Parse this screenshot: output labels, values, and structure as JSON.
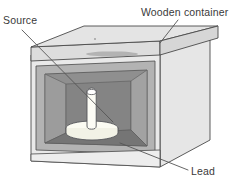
{
  "figure": {
    "type": "cutaway-isometric-diagram",
    "width": 238,
    "height": 192,
    "background": "#ffffff"
  },
  "labels": {
    "source": "Source",
    "wooden_container": "Wooden container",
    "lead": "Lead"
  },
  "leaders": [
    {
      "name": "source-leader",
      "from": [
        22,
        30
      ],
      "to": [
        113,
        122
      ]
    },
    {
      "name": "wooden-leader",
      "from": [
        178,
        20
      ],
      "to": [
        160,
        42
      ]
    },
    {
      "name": "lead-leader",
      "from": [
        188,
        170
      ],
      "to": [
        120,
        143
      ]
    }
  ],
  "parts": [
    {
      "name": "lid-top-face",
      "label": "Wooden lid (top face)",
      "color": "#e2e2e2"
    },
    {
      "name": "lid-front-edge",
      "label": "Wooden lid (front edge)",
      "color": "#dcdcdc"
    },
    {
      "name": "front-frame",
      "label": "Wooden container front frame",
      "color": "#e8e8e8"
    },
    {
      "name": "right-side-panel",
      "label": "Wooden container right side",
      "color": "#e6e6e6"
    },
    {
      "name": "lead-front-band",
      "label": "Lead lining (front)",
      "color": "#b0b0b0"
    },
    {
      "name": "lead-inner-left",
      "label": "Lead lining (left inner wall)",
      "color": "#9a9a9a"
    },
    {
      "name": "lead-inner-back",
      "label": "Lead lining (back wall)",
      "color": "#8a8a8a"
    },
    {
      "name": "lead-inner-right",
      "label": "Lead lining (right inner wall)",
      "color": "#9e9e9e"
    },
    {
      "name": "lead-inner-floor",
      "label": "Lead lining (floor)",
      "color": "#767676"
    },
    {
      "name": "source-pillar",
      "label": "Source rod",
      "color": "#fbfbf4"
    },
    {
      "name": "source-disc",
      "label": "Source base disc",
      "color": "#f7f7ee"
    }
  ],
  "colors": {
    "outline": "#4a4a4a",
    "leader": "#555555",
    "text": "#3a3a3a",
    "wood_light": "#e8e8e8",
    "wood_mid": "#dcdcdc",
    "lead_light": "#b5b5b5",
    "lead_mid": "#9a9a9a",
    "lead_dark": "#7d7d7d",
    "cavity": "#6f6f6f",
    "source_white": "#fbfbf4"
  }
}
